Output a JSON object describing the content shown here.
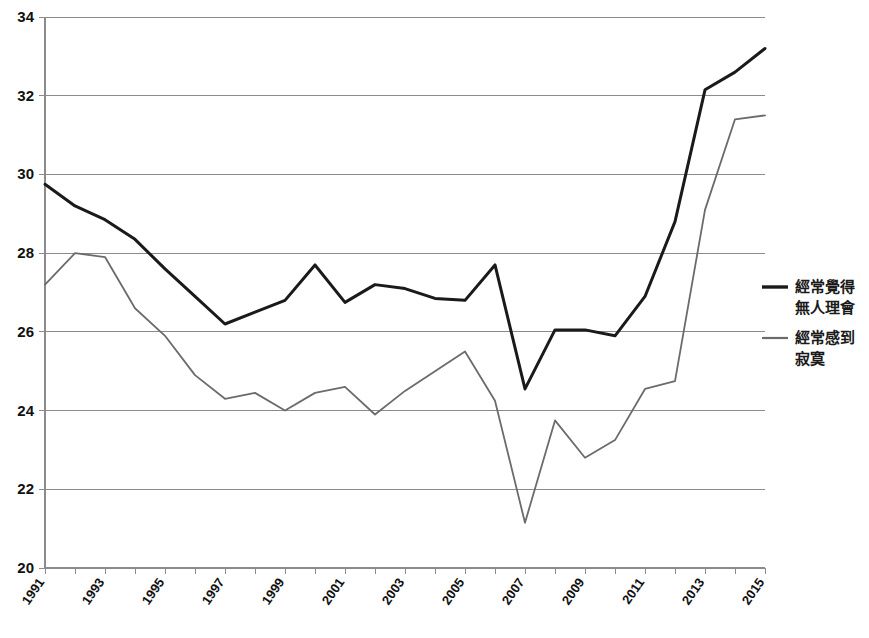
{
  "chart_data": {
    "type": "line",
    "title": "",
    "subtitle": "",
    "xlabel": "",
    "ylabel": "",
    "x": [
      1991,
      1992,
      1993,
      1994,
      1995,
      1996,
      1997,
      1998,
      1999,
      2000,
      2001,
      2002,
      2003,
      2004,
      2005,
      2006,
      2007,
      2008,
      2009,
      2010,
      2011,
      2012,
      2013,
      2014,
      2015
    ],
    "xlim": [
      1991,
      2015
    ],
    "ylim": [
      20,
      34
    ],
    "yticks": [
      20,
      22,
      24,
      26,
      28,
      30,
      32,
      34
    ],
    "xticks": [
      1991,
      1992,
      1993,
      1994,
      1995,
      1996,
      1997,
      1998,
      1999,
      2000,
      2001,
      2002,
      2003,
      2004,
      2005,
      2006,
      2007,
      2008,
      2009,
      2010,
      2011,
      2012,
      2013,
      2014,
      2015
    ],
    "xtick_labels": [
      "1991",
      "",
      "1993",
      "",
      "1995",
      "",
      "1997",
      "",
      "1999",
      "",
      "2001",
      "",
      "2003",
      "",
      "2005",
      "",
      "2007",
      "",
      "2009",
      "",
      "2011",
      "",
      "2013",
      "",
      "2015"
    ],
    "grid": true,
    "grid_axis": "y",
    "legend_position": "right",
    "series": [
      {
        "name": "經常覺得無人理會",
        "color": "#1a1a1a",
        "width": 3,
        "values": [
          29.75,
          29.2,
          28.85,
          28.35,
          27.6,
          26.9,
          26.2,
          26.5,
          26.8,
          27.7,
          26.75,
          27.2,
          27.1,
          26.85,
          26.8,
          27.7,
          24.55,
          26.05,
          26.05,
          25.9,
          26.9,
          28.8,
          32.15,
          32.6,
          33.2
        ]
      },
      {
        "name": "經常感到寂寞",
        "color": "#6b6b6b",
        "width": 1.8,
        "values": [
          27.2,
          28.0,
          27.9,
          26.6,
          25.9,
          24.9,
          24.3,
          24.45,
          24.0,
          24.45,
          24.6,
          23.9,
          24.5,
          25.0,
          25.5,
          24.25,
          21.15,
          23.75,
          22.8,
          23.25,
          24.55,
          24.75,
          29.1,
          31.4,
          31.5
        ]
      }
    ],
    "legend": [
      {
        "label_line1": "經常覺得",
        "label_line2": "無人理會",
        "color": "#1a1a1a"
      },
      {
        "label_line1": "經常感到",
        "label_line2": "寂寞",
        "color": "#6b6b6b"
      }
    ]
  },
  "layout": {
    "plot_left": 45,
    "plot_right": 765,
    "plot_top": 17,
    "plot_bottom": 568
  }
}
